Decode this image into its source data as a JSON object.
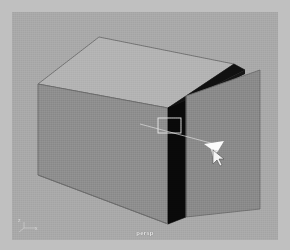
{
  "app": {
    "window_title": "persp",
    "background_color": "#c0c0c0",
    "viewport_background_color": "#a9a9a9"
  },
  "viewport": {
    "label": "persp",
    "label_color": "#efefef",
    "shading_mode": "smooth-shaded",
    "camera": "persp"
  },
  "axis_gizmo": {
    "name": "origin-axis-indicator",
    "x_label": "x",
    "z_label": "z",
    "color": "#d8d8d8"
  },
  "geometry": {
    "object_name": "polygon-cube",
    "faces": [
      {
        "name": "top-face",
        "fill": "#b4b4b4",
        "points": "87,25 222,52 156,96 26,72"
      },
      {
        "name": "left-front-face",
        "fill": "#8f8f8f",
        "points": "26,72 156,96 156,212 26,163"
      },
      {
        "name": "interior-shadow",
        "fill": "#0a0a0a",
        "points": "156,96 173,88 173,206 156,212"
      },
      {
        "name": "top-shadow-band",
        "fill": "#121212",
        "points": "222,52 232,58 176,87 156,96"
      },
      {
        "name": "door-panel",
        "fill": "#8b8b8b",
        "points": "173,84 247,60 247,198 173,206"
      }
    ],
    "edges": [
      {
        "name": "top-left-edge",
        "color": "#6f6f6f"
      },
      {
        "name": "top-right-edge",
        "color": "#6f6f6f"
      },
      {
        "name": "vertical-edge",
        "color": "#5d5d5d"
      },
      {
        "name": "bottom-edge",
        "color": "#6d6d6d"
      }
    ]
  },
  "manipulator": {
    "name": "selection-handle",
    "selection_box": {
      "x": 146,
      "y": 107,
      "w": 22,
      "h": 14,
      "stroke": "#e6e6e6"
    },
    "leader_line": {
      "from": [
        131,
        114
      ],
      "to": [
        205,
        134
      ],
      "stroke": "#dcdcdc"
    },
    "arrow_color": "#fcfcfc"
  },
  "cursor": {
    "name": "mouse-pointer",
    "x": 203,
    "y": 140,
    "color": "#f2f2f2"
  }
}
